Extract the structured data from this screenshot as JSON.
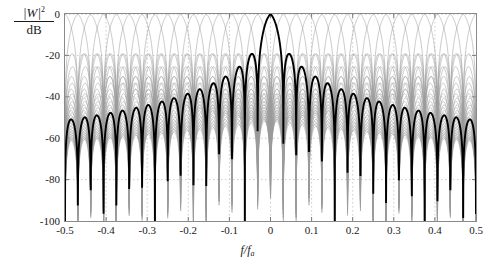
{
  "chart_data": {
    "type": "line",
    "title": "",
    "xlabel": "f/f",
    "xlabel_sub": "a",
    "ylabel_numerator": "|W|",
    "ylabel_numerator_exp": "2",
    "ylabel_denominator": "dB",
    "xlim": [
      -0.5,
      0.5
    ],
    "ylim": [
      -100,
      0
    ],
    "xticks": [
      -0.5,
      -0.4,
      -0.3,
      -0.2,
      -0.1,
      0,
      0.1,
      0.2,
      0.3,
      0.4,
      0.5
    ],
    "xticklabels": [
      "-0.5",
      "-0.4",
      "-0.3",
      "-0.2",
      "-0.1",
      "0",
      "0.1",
      "0.2",
      "0.3",
      "0.4",
      "0.5"
    ],
    "yticks": [
      0,
      -20,
      -40,
      -60,
      -80,
      -100
    ],
    "yticklabels": [
      "0",
      "-20",
      "-40",
      "-60",
      "-80",
      "-100"
    ],
    "grid": true,
    "grid_style": "dotted",
    "legend": "none",
    "channel_count": 32,
    "channel_spacing": 0.03125,
    "highlighted_channel_center": 0,
    "highlighted_channel_peak_db": 0,
    "background_channel_peak_db": 0,
    "first_sidelobe_db": -31,
    "colors": {
      "highlight_curve": "#000000",
      "background_curve": "#9a9a9a",
      "axis": "#8a8a8a",
      "grid": "#bfbfbf",
      "text": "#1a1a1a",
      "background": "#ffffff"
    }
  },
  "axes": {
    "y_label_numerator": "|W|",
    "y_label_exponent": "2",
    "y_label_denominator": "dB",
    "x_label": "f/f",
    "x_label_subscript": "a"
  }
}
